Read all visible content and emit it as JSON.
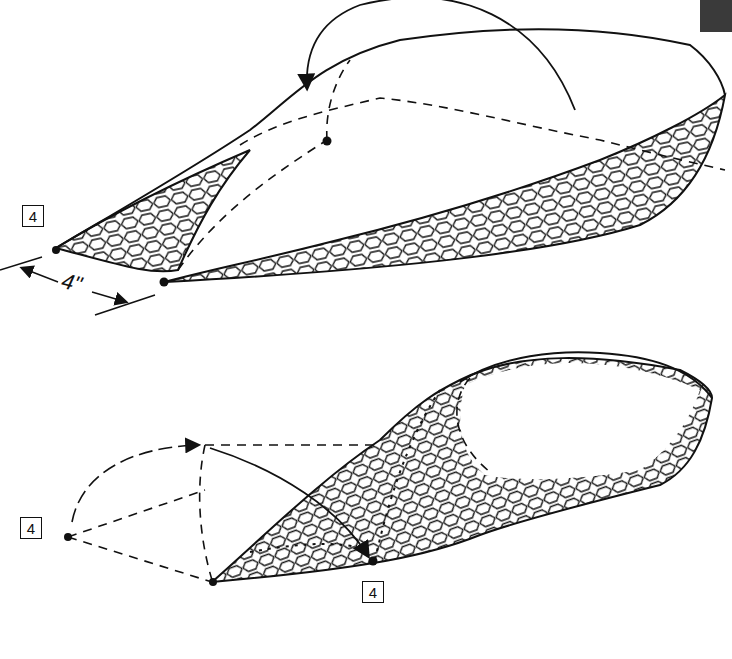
{
  "diagram": {
    "colors": {
      "ink": "#111111",
      "background": "#ffffff",
      "corner_mark": "#3a3a3a"
    },
    "top_figure": {
      "step_badge": "4",
      "dimension_label": "4\"",
      "elements": [
        "mesh-body",
        "fold-arrow-curved",
        "dashed-fold-lines",
        "corner-points",
        "dimension-arrows"
      ]
    },
    "bottom_figure": {
      "step_badge_left": "4",
      "step_badge_bottom": "4",
      "elements": [
        "mesh-body",
        "fold-arrow-curved",
        "dashed-fold-lines",
        "stitch-marks",
        "corner-points"
      ]
    }
  }
}
